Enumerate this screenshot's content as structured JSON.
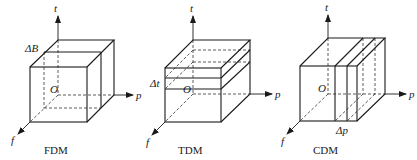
{
  "figure": {
    "panels": [
      {
        "id": "fdm",
        "caption": "FDM",
        "slice_label": "ΔB",
        "axes": {
          "t": "t",
          "p": "p",
          "f": "f",
          "origin": "O"
        },
        "description": "Frequency division multiplexing: cube sliced along the f axis"
      },
      {
        "id": "tdm",
        "caption": "TDM",
        "slice_label": "Δt",
        "axes": {
          "t": "t",
          "p": "p",
          "f": "f",
          "origin": "O"
        },
        "description": "Time division multiplexing: cube sliced along the t axis"
      },
      {
        "id": "cdm",
        "caption": "CDM",
        "slice_label": "Δp",
        "axes": {
          "t": "t",
          "p": "p",
          "f": "f",
          "origin": "O"
        },
        "description": "Code division multiplexing: cube sliced along the p axis"
      }
    ]
  }
}
